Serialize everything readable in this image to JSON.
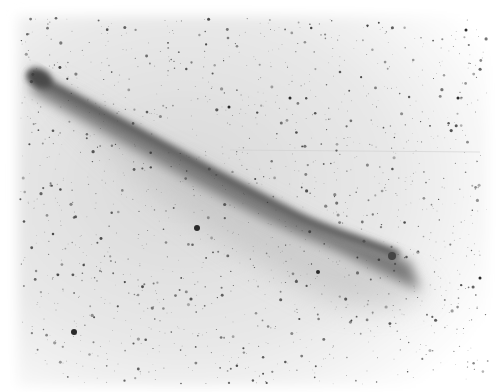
{
  "image": {
    "subject": "Negative photographic plate of a comet with a long tail against a star field",
    "colors": {
      "background": "#ffffff",
      "sky": "#e6e6e6",
      "tail_core": "#6a6a6a",
      "head": "#4a4a4a",
      "stars": "#333333"
    },
    "comet": {
      "head": {
        "x": 40,
        "y": 78
      },
      "tail_end": {
        "x": 415,
        "y": 290
      },
      "bright_knot": {
        "x": 392,
        "y": 256
      }
    },
    "field_stars": [
      {
        "x": 197,
        "y": 228,
        "r": 3
      },
      {
        "x": 74,
        "y": 332,
        "r": 3
      },
      {
        "x": 318,
        "y": 272,
        "r": 2
      },
      {
        "x": 229,
        "y": 107,
        "r": 1.5
      },
      {
        "x": 290,
        "y": 98,
        "r": 1.5
      },
      {
        "x": 458,
        "y": 98,
        "r": 1.5
      },
      {
        "x": 480,
        "y": 278,
        "r": 1.5
      },
      {
        "x": 466,
        "y": 30,
        "r": 1.5
      }
    ]
  }
}
